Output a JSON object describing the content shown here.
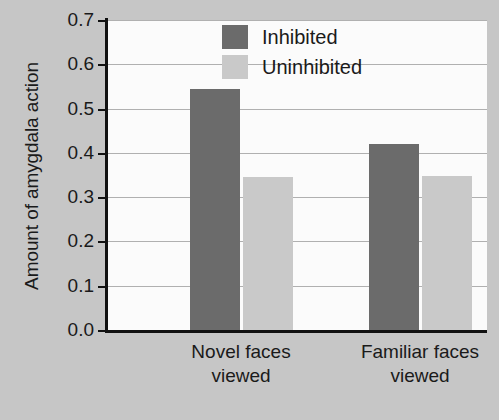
{
  "chart_data": {
    "type": "bar",
    "title": "",
    "xlabel": "",
    "ylabel": "Amount of amygdala action",
    "categories": [
      "Novel faces viewed",
      "Familiar faces viewed"
    ],
    "category_lines": [
      [
        "Novel faces",
        "viewed"
      ],
      [
        "Familiar faces",
        "viewed"
      ]
    ],
    "series": [
      {
        "name": "Inhibited",
        "color": "#6b6b6b",
        "values": [
          0.545,
          0.42
        ]
      },
      {
        "name": "Uninhibited",
        "color": "#c9c9c9",
        "values": [
          0.345,
          0.347
        ]
      }
    ],
    "ylim": [
      0.0,
      0.7
    ],
    "ytick_labels": [
      "0.7",
      "0.6",
      "0.5",
      "0.4",
      "0.3",
      "0.2",
      "0.1",
      "0.0"
    ],
    "ytick_values": [
      0.7,
      0.6,
      0.5,
      0.4,
      0.3,
      0.2,
      0.1,
      0.0
    ],
    "grid": true,
    "legend_position": "top-right",
    "colors": {
      "background": "#c6c6c6",
      "plot_background": "#fbfbfb",
      "axis": "#111111",
      "gridline": "#b0b0b0",
      "text": "#1a1a1a"
    }
  }
}
